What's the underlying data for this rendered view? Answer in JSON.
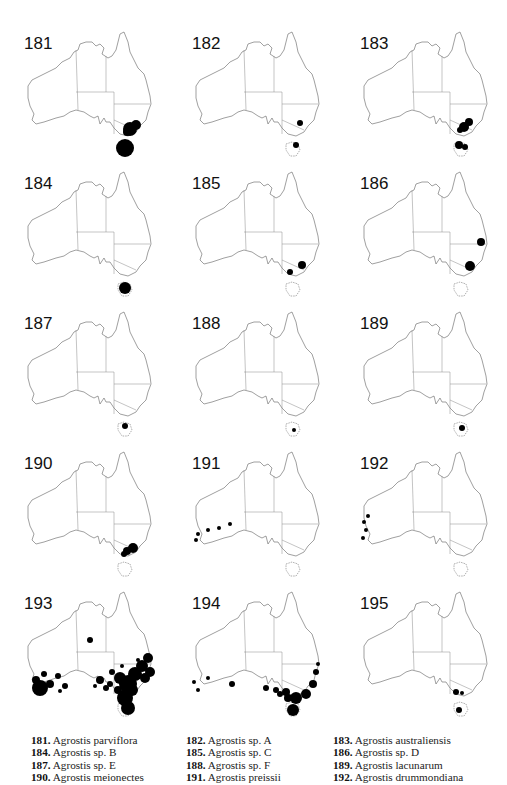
{
  "figure": {
    "maps": [
      {
        "id": "181",
        "left": 0,
        "top": 20,
        "dots": [
          [
            130,
            109,
            7
          ],
          [
            136,
            105,
            5
          ],
          [
            127,
            112,
            4
          ],
          [
            125,
            128,
            9
          ]
        ]
      },
      {
        "id": "182",
        "left": 168,
        "top": 20,
        "dots": [
          [
            132,
            103,
            3
          ],
          [
            128,
            125,
            3
          ]
        ]
      },
      {
        "id": "183",
        "left": 336,
        "top": 20,
        "dots": [
          [
            128,
            107,
            5
          ],
          [
            133,
            102,
            4
          ],
          [
            124,
            110,
            3
          ],
          [
            123,
            125,
            4
          ],
          [
            129,
            127,
            3
          ]
        ]
      },
      {
        "id": "184",
        "left": 0,
        "top": 160,
        "dots": [
          [
            125,
            128,
            6
          ]
        ]
      },
      {
        "id": "185",
        "left": 168,
        "top": 160,
        "dots": [
          [
            134,
            105,
            4
          ],
          [
            122,
            112,
            3
          ]
        ]
      },
      {
        "id": "186",
        "left": 336,
        "top": 160,
        "dots": [
          [
            145,
            82,
            4
          ],
          [
            134,
            106,
            5
          ]
        ]
      },
      {
        "id": "187",
        "left": 0,
        "top": 300,
        "dots": [
          [
            125,
            126,
            3
          ]
        ]
      },
      {
        "id": "188",
        "left": 168,
        "top": 300,
        "dots": [
          [
            126,
            130,
            2
          ]
        ]
      },
      {
        "id": "189",
        "left": 336,
        "top": 300,
        "dots": [
          [
            126,
            128,
            3
          ]
        ]
      },
      {
        "id": "190",
        "left": 0,
        "top": 440,
        "dots": [
          [
            133,
            108,
            5
          ],
          [
            127,
            111,
            4
          ],
          [
            124,
            114,
            3
          ]
        ]
      },
      {
        "id": "191",
        "left": 168,
        "top": 440,
        "dots": [
          [
            30,
            94,
            2
          ],
          [
            40,
            90,
            2
          ],
          [
            51,
            88,
            2
          ],
          [
            62,
            84,
            2
          ],
          [
            28,
            100,
            2
          ]
        ]
      },
      {
        "id": "192",
        "left": 336,
        "top": 440,
        "dots": [
          [
            28,
            82,
            2
          ],
          [
            30,
            90,
            2
          ],
          [
            27,
            98,
            2
          ],
          [
            32,
            76,
            2
          ]
        ]
      },
      {
        "id": "193",
        "left": 0,
        "top": 580,
        "dots": [
          [
            40,
            108,
            8
          ],
          [
            36,
            100,
            4
          ],
          [
            44,
            94,
            3
          ],
          [
            50,
            104,
            4
          ],
          [
            58,
            96,
            3
          ],
          [
            65,
            106,
            3
          ],
          [
            60,
            111,
            2
          ],
          [
            90,
            60,
            3
          ],
          [
            100,
            100,
            4
          ],
          [
            110,
            104,
            3
          ],
          [
            120,
            98,
            6
          ],
          [
            128,
            104,
            9
          ],
          [
            135,
            94,
            7
          ],
          [
            142,
            86,
            6
          ],
          [
            148,
            78,
            5
          ],
          [
            150,
            92,
            5
          ],
          [
            145,
            98,
            5
          ],
          [
            125,
            118,
            8
          ],
          [
            128,
            128,
            7
          ],
          [
            118,
            110,
            4
          ],
          [
            106,
            108,
            3
          ],
          [
            95,
            106,
            2
          ],
          [
            112,
            92,
            3
          ],
          [
            122,
            86,
            2
          ],
          [
            138,
            80,
            2
          ],
          [
            132,
            110,
            6
          ]
        ]
      },
      {
        "id": "194",
        "left": 168,
        "top": 580,
        "dots": [
          [
            26,
            102,
            2
          ],
          [
            30,
            110,
            2
          ],
          [
            40,
            98,
            2
          ],
          [
            64,
            104,
            3
          ],
          [
            98,
            108,
            3
          ],
          [
            108,
            110,
            3
          ],
          [
            118,
            112,
            4
          ],
          [
            128,
            118,
            6
          ],
          [
            138,
            114,
            5
          ],
          [
            145,
            104,
            4
          ],
          [
            148,
            92,
            3
          ],
          [
            150,
            84,
            2
          ],
          [
            125,
            130,
            6
          ],
          [
            120,
            118,
            4
          ],
          [
            112,
            114,
            3
          ]
        ]
      },
      {
        "id": "195",
        "left": 336,
        "top": 580,
        "dots": [
          [
            120,
            112,
            3
          ],
          [
            126,
            113,
            2
          ],
          [
            123,
            130,
            3
          ]
        ]
      }
    ]
  },
  "caption": {
    "columns": [
      [
        {
          "num": "181.",
          "name": "Agrostis parviflora"
        },
        {
          "num": "184.",
          "name": "Agrostis sp. B"
        },
        {
          "num": "187.",
          "name": "Agrostis sp. E"
        },
        {
          "num": "190.",
          "name": "Agrostis meionectes"
        }
      ],
      [
        {
          "num": "182.",
          "name": "Agrostis sp. A"
        },
        {
          "num": "185.",
          "name": "Agrostis sp. C"
        },
        {
          "num": "188.",
          "name": "Agrostis sp. F"
        },
        {
          "num": "191.",
          "name": "Agrostis preissii"
        }
      ],
      [
        {
          "num": "183.",
          "name": "Agrostis australiensis"
        },
        {
          "num": "186.",
          "name": "Agrostis sp. D"
        },
        {
          "num": "189.",
          "name": "Agrostis lacunarum"
        },
        {
          "num": "192.",
          "name": "Agrostis drummondiana"
        }
      ]
    ]
  }
}
